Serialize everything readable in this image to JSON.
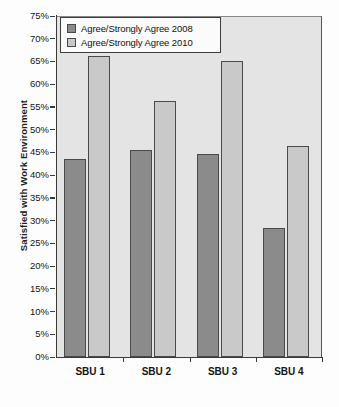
{
  "chart_data": {
    "type": "bar",
    "title": "",
    "xlabel": "",
    "ylabel": "Satisfied with Work Environment",
    "categories": [
      "SBU 1",
      "SBU 2",
      "SBU 3",
      "SBU 4"
    ],
    "series": [
      {
        "name": "Agree/Strongly Agree 2008",
        "color": "#8b8b8b",
        "values": [
          43.5,
          45.6,
          44.6,
          28.3
        ]
      },
      {
        "name": "Agree/Strongly Agree 2010",
        "color": "#c9c9c9",
        "values": [
          66.2,
          56.3,
          65.2,
          46.5
        ]
      }
    ],
    "ylim": [
      0,
      75
    ],
    "ytick_step": 5,
    "ytick_labels": [
      "0%",
      "5%",
      "10%",
      "15%",
      "20%",
      "25%",
      "30%",
      "35%",
      "40%",
      "45%",
      "50%",
      "55%",
      "60%",
      "65%",
      "70%",
      "75%"
    ],
    "ytick_values": [
      0,
      5,
      10,
      15,
      20,
      25,
      30,
      35,
      40,
      45,
      50,
      55,
      60,
      65,
      70,
      75
    ],
    "grid": false,
    "legend_position": "top-left",
    "plot_background": "#e4e4e4",
    "axis_color": "#3a3a3a"
  },
  "legend": {
    "items": [
      {
        "label": "Agree/Strongly Agree 2008"
      },
      {
        "label": "Agree/Strongly Agree 2010"
      }
    ]
  }
}
